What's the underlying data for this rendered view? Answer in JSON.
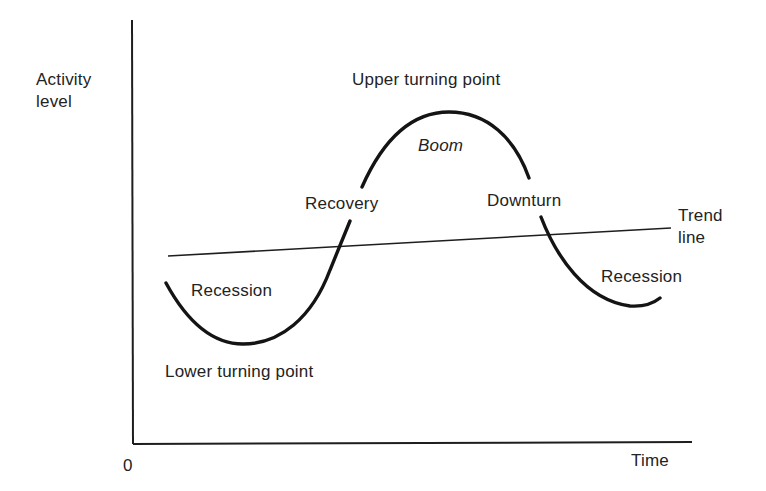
{
  "diagram": {
    "y_axis_label_line1": "Activity",
    "y_axis_label_line2": "level",
    "x_axis_label": "Time",
    "origin_label": "0",
    "labels": {
      "upper_turning_point": "Upper turning point",
      "boom": "Boom",
      "recovery": "Recovery",
      "downturn": "Downturn",
      "trend_line_1": "Trend",
      "trend_line_2": "line",
      "recession_left": "Recession",
      "recession_right": "Recession",
      "lower_turning_point": "Lower turning point"
    },
    "colors": {
      "ink": "#1e1e1e",
      "background": "#ffffff"
    },
    "phases": [
      "Recession",
      "Lower turning point",
      "Recovery",
      "Boom",
      "Upper turning point",
      "Downturn",
      "Recession"
    ]
  }
}
